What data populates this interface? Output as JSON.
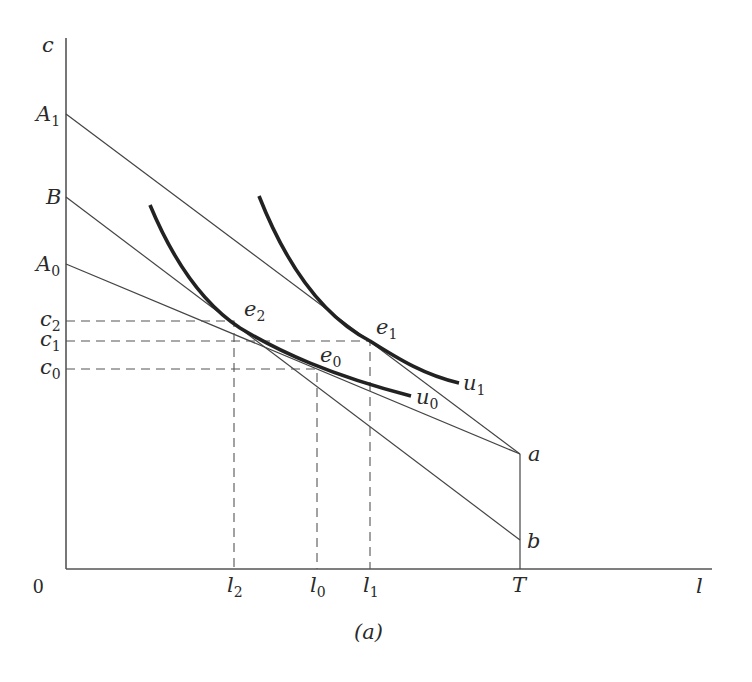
{
  "figure": {
    "caption": "(a)",
    "axes": {
      "y_label": "c",
      "x_label": "l",
      "origin_label": "0"
    },
    "y_ticks": [
      {
        "id": "A1",
        "main": "A",
        "sub": "1"
      },
      {
        "id": "B",
        "main": "B",
        "sub": ""
      },
      {
        "id": "A0",
        "main": "A",
        "sub": "0"
      },
      {
        "id": "c2",
        "main": "c",
        "sub": "2"
      },
      {
        "id": "c1",
        "main": "c",
        "sub": "1"
      },
      {
        "id": "c0",
        "main": "c",
        "sub": "0"
      }
    ],
    "x_ticks": [
      {
        "id": "l2",
        "main": "l",
        "sub": "2"
      },
      {
        "id": "l0",
        "main": "l",
        "sub": "0"
      },
      {
        "id": "l1",
        "main": "l",
        "sub": "1"
      },
      {
        "id": "T",
        "main": "T",
        "sub": ""
      }
    ],
    "points": [
      {
        "id": "e2",
        "main": "e",
        "sub": "2"
      },
      {
        "id": "e1",
        "main": "e",
        "sub": "1"
      },
      {
        "id": "e0",
        "main": "e",
        "sub": "0"
      },
      {
        "id": "a",
        "main": "a",
        "sub": ""
      },
      {
        "id": "b",
        "main": "b",
        "sub": ""
      }
    ],
    "curves": [
      {
        "id": "u1",
        "main": "u",
        "sub": "1"
      },
      {
        "id": "u0",
        "main": "u",
        "sub": "0"
      }
    ],
    "lines": [
      {
        "from": "A1",
        "to": "a"
      },
      {
        "from": "B",
        "to": "b"
      },
      {
        "from": "A0",
        "to": "a"
      },
      {
        "from": "a",
        "to": "T"
      }
    ]
  }
}
